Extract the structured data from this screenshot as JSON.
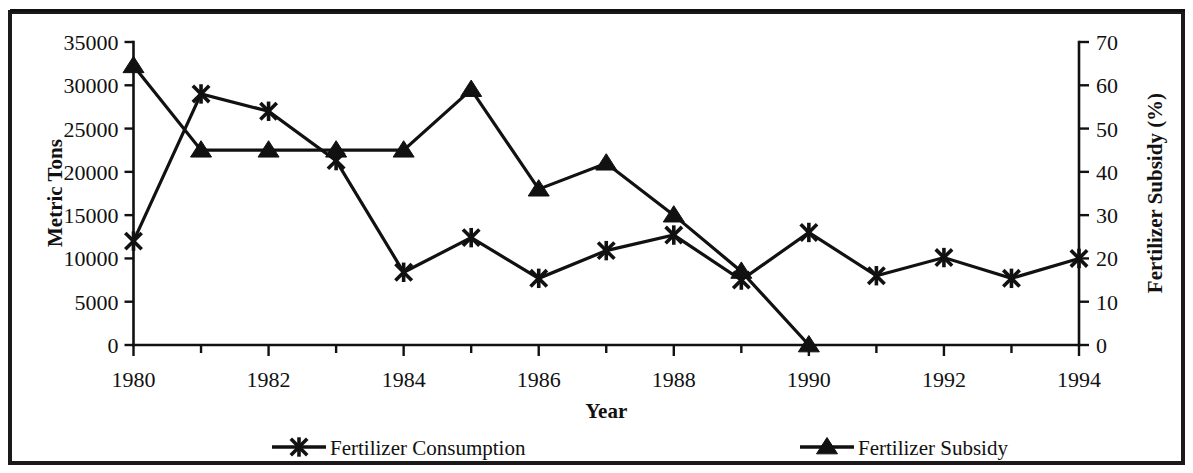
{
  "chart_data": {
    "type": "line",
    "title": "",
    "xlabel": "Year",
    "ylabel": "Metric Tons",
    "y2label": "Fertilizer Subsidy (%)",
    "x": [
      1980,
      1981,
      1982,
      1983,
      1984,
      1985,
      1986,
      1987,
      1988,
      1989,
      1990,
      1991,
      1992,
      1993,
      1994
    ],
    "xlim": [
      1980,
      1994
    ],
    "xtick_labels": [
      "1980",
      "1982",
      "1984",
      "1986",
      "1988",
      "1990",
      "1992",
      "1994"
    ],
    "xtick_values": [
      1980,
      1982,
      1984,
      1986,
      1988,
      1990,
      1992,
      1994
    ],
    "ylim": [
      0,
      35000
    ],
    "ytick_labels": [
      "0",
      "5000",
      "10000",
      "15000",
      "20000",
      "25000",
      "30000",
      "35000"
    ],
    "ytick_values": [
      0,
      5000,
      10000,
      15000,
      20000,
      25000,
      30000,
      35000
    ],
    "y2lim": [
      0,
      70
    ],
    "y2tick_labels": [
      "0",
      "10",
      "20",
      "30",
      "40",
      "50",
      "60",
      "70"
    ],
    "y2tick_values": [
      0,
      10,
      20,
      30,
      40,
      50,
      60,
      70
    ],
    "grid": false,
    "legend_position": "bottom",
    "series": [
      {
        "name": "Fertilizer Consumption",
        "axis": "left",
        "marker": "x-star",
        "x": [
          1980,
          1981,
          1982,
          1983,
          1984,
          1985,
          1986,
          1987,
          1988,
          1989,
          1990,
          1991,
          1992,
          1993,
          1994
        ],
        "values": [
          12000,
          29000,
          27000,
          21300,
          8400,
          12400,
          7700,
          10900,
          12700,
          7500,
          13000,
          8000,
          10100,
          7700,
          10000
        ]
      },
      {
        "name": "Fertilizer Subsidy",
        "axis": "right",
        "marker": "triangle",
        "x": [
          1980,
          1981,
          1982,
          1983,
          1984,
          1985,
          1986,
          1987,
          1988,
          1989,
          1990
        ],
        "values": [
          64.5,
          45,
          45,
          45,
          45,
          59,
          36,
          42,
          30,
          17,
          0
        ]
      }
    ]
  },
  "legend": {
    "items": [
      {
        "label": "Fertilizer Consumption",
        "marker": "x-star"
      },
      {
        "label": "Fertilizer Subsidy",
        "marker": "triangle"
      }
    ]
  },
  "colors": {
    "ink": "#111111",
    "background": "#ffffff"
  }
}
